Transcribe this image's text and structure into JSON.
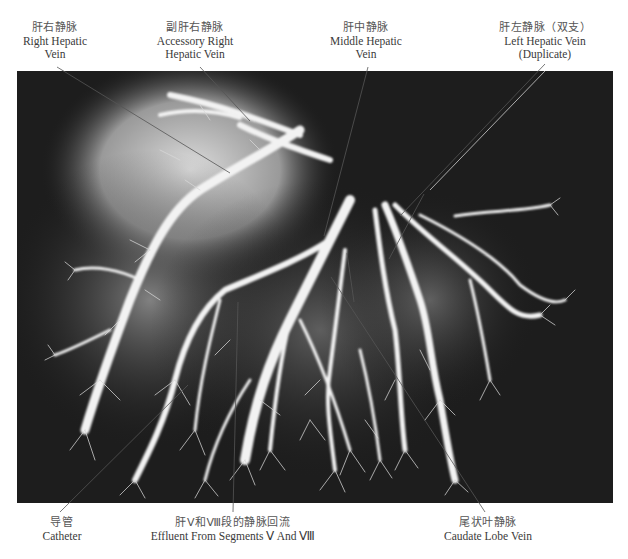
{
  "figure": {
    "image": {
      "description": "Hepatic vein cast angiogram",
      "background_color": "#1c1c1c",
      "vein_color": "#f4f4f4"
    },
    "labels_top": [
      {
        "zh": "肝右静脉",
        "en_lines": [
          "Right Hepatic",
          "Vein"
        ],
        "x": 55
      },
      {
        "zh": "副肝右静脉",
        "en_lines": [
          "Accessory Right",
          "Hepatic Vein"
        ],
        "x": 195
      },
      {
        "zh": "肝中静脉",
        "en_lines": [
          "Middle Hepatic",
          "Vein"
        ],
        "x": 365
      },
      {
        "zh": "肝左静脉（双支）",
        "en_lines": [
          "Left Hepatic Vein",
          "(Duplicate)"
        ],
        "x": 545
      }
    ],
    "labels_bottom": [
      {
        "zh": "导管",
        "en_lines": [
          "Catheter"
        ],
        "x": 67
      },
      {
        "zh": "肝Ⅴ和Ⅷ段的静脉回流",
        "en_lines": [
          "Effluent From Segments Ⅴ And Ⅷ"
        ],
        "x": 233
      },
      {
        "zh": "尾状叶静脉",
        "en_lines": [
          "Caudate Lobe Vein"
        ],
        "x": 495
      }
    ]
  }
}
